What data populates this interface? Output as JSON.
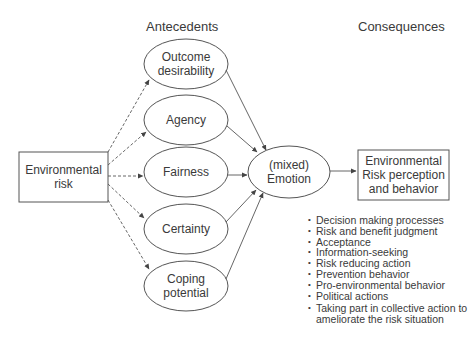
{
  "headings": {
    "antecedents": "Antecedents",
    "consequences": "Consequences"
  },
  "source_box": {
    "line1": "Environmental",
    "line2": "risk"
  },
  "antecedents": [
    {
      "line1": "Outcome",
      "line2": "desirability"
    },
    {
      "line1": "Agency",
      "line2": ""
    },
    {
      "line1": "Fairness",
      "line2": ""
    },
    {
      "line1": "Certainty",
      "line2": ""
    },
    {
      "line1": "Coping",
      "line2": "potential"
    }
  ],
  "emotion": {
    "line1": "(mixed)",
    "line2": "Emotion"
  },
  "outcome_box": {
    "line1": "Environmental",
    "line2": "Risk perception",
    "line3": "and behavior"
  },
  "consequences_list": [
    "Decision making processes",
    "Risk and benefit judgment",
    "Acceptance",
    "Information-seeking",
    "Risk reducing action",
    "Prevention behavior",
    "Pro-environmental behavior",
    "Political actions",
    "Taking part in collective action to",
    "ameliorate the risk situation"
  ],
  "colors": {
    "stroke": "#555555",
    "text": "#3a3a3a",
    "background": "#ffffff"
  }
}
